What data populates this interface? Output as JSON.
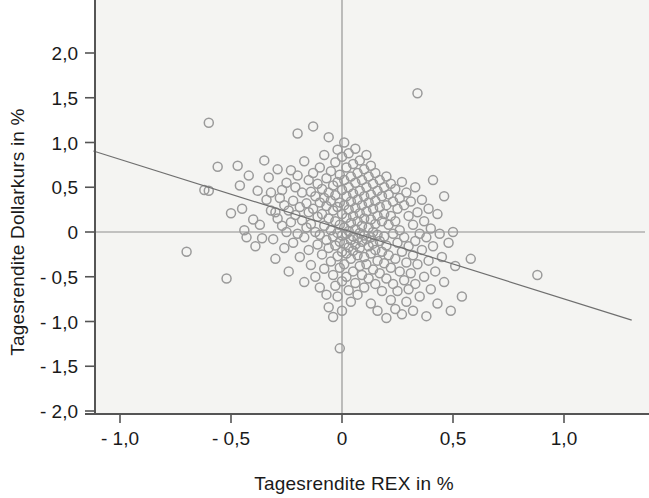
{
  "chart_data": {
    "type": "scatter",
    "title": "",
    "xlabel": "Tagesrendite REX in %",
    "ylabel": "Tagesrendite Dollarkurs in %",
    "xlim": [
      -1.12,
      1.38
    ],
    "ylim": [
      -2.08,
      2.28
    ],
    "xticks": [
      -1.0,
      -0.5,
      0,
      0.5,
      1.0
    ],
    "xticklabels": [
      "- 1,0",
      "- 0,5",
      "0",
      "0,5",
      "1,0"
    ],
    "yticks": [
      2.0,
      1.5,
      1.0,
      0.5,
      0,
      -0.5,
      -1.0,
      -1.5,
      -2.0
    ],
    "yticklabels": [
      "2,0",
      "1,5",
      "1,0",
      "0,5",
      "0",
      "- 0,5",
      "- 1,0",
      "- 1,5",
      "- 2,0"
    ],
    "grid": false,
    "legend": null,
    "marker": "open-circle",
    "marker_color": "#9a9a9a",
    "marker_size": 9,
    "plot_bg": "#f4f4f2",
    "axis_color": "#555555",
    "reference_lines": [
      {
        "name": "zero-horizontal",
        "orientation": "horizontal",
        "value": 0
      },
      {
        "name": "zero-vertical",
        "orientation": "vertical",
        "value": 0
      }
    ],
    "trendline": {
      "name": "regression-line",
      "x_start": -1.12,
      "y_start": 0.905,
      "x_end": 1.305,
      "y_end": -0.985,
      "slope": -0.781,
      "intercept": 0.03
    },
    "points": [
      [
        -0.7,
        -0.22
      ],
      [
        -0.62,
        0.47
      ],
      [
        -0.6,
        1.22
      ],
      [
        -0.6,
        0.46
      ],
      [
        -0.56,
        0.73
      ],
      [
        -0.52,
        -0.52
      ],
      [
        -0.5,
        0.21
      ],
      [
        -0.47,
        0.74
      ],
      [
        -0.46,
        0.52
      ],
      [
        -0.45,
        0.26
      ],
      [
        -0.44,
        0.02
      ],
      [
        -0.43,
        -0.06
      ],
      [
        -0.42,
        0.63
      ],
      [
        -0.4,
        0.14
      ],
      [
        -0.39,
        -0.16
      ],
      [
        -0.38,
        0.46
      ],
      [
        -0.37,
        0.08
      ],
      [
        -0.36,
        -0.07
      ],
      [
        -0.35,
        0.8
      ],
      [
        -0.34,
        0.36
      ],
      [
        -0.33,
        0.61
      ],
      [
        -0.32,
        0.24
      ],
      [
        -0.32,
        0.44
      ],
      [
        -0.31,
        -0.08
      ],
      [
        -0.3,
        0.22
      ],
      [
        -0.3,
        -0.3
      ],
      [
        -0.29,
        0.15
      ],
      [
        -0.29,
        0.7
      ],
      [
        -0.28,
        0.38
      ],
      [
        -0.27,
        0.07
      ],
      [
        -0.27,
        0.47
      ],
      [
        -0.26,
        -0.18
      ],
      [
        -0.26,
        0.3
      ],
      [
        -0.25,
        0.55
      ],
      [
        -0.25,
        0.0
      ],
      [
        -0.24,
        0.24
      ],
      [
        -0.24,
        -0.44
      ],
      [
        -0.23,
        0.69
      ],
      [
        -0.23,
        0.11
      ],
      [
        -0.22,
        0.35
      ],
      [
        -0.22,
        -0.12
      ],
      [
        -0.21,
        0.5
      ],
      [
        -0.21,
        0.19
      ],
      [
        -0.2,
        1.1
      ],
      [
        -0.2,
        0.63
      ],
      [
        -0.2,
        -0.02
      ],
      [
        -0.19,
        0.28
      ],
      [
        -0.19,
        -0.28
      ],
      [
        -0.18,
        0.44
      ],
      [
        -0.18,
        0.13
      ],
      [
        -0.17,
        0.79
      ],
      [
        -0.17,
        -0.06
      ],
      [
        -0.17,
        -0.56
      ],
      [
        -0.16,
        0.32
      ],
      [
        -0.16,
        0.05
      ],
      [
        -0.15,
        0.58
      ],
      [
        -0.15,
        0.22
      ],
      [
        -0.15,
        -0.2
      ],
      [
        -0.14,
        0.45
      ],
      [
        -0.14,
        0.09
      ],
      [
        -0.14,
        -0.37
      ],
      [
        -0.13,
        1.18
      ],
      [
        -0.13,
        0.66
      ],
      [
        -0.13,
        0.26
      ],
      [
        -0.12,
        0.4
      ],
      [
        -0.12,
        0.0
      ],
      [
        -0.12,
        -0.5
      ],
      [
        -0.11,
        0.54
      ],
      [
        -0.11,
        0.17
      ],
      [
        -0.11,
        -0.14
      ],
      [
        -0.1,
        0.72
      ],
      [
        -0.1,
        0.33
      ],
      [
        -0.1,
        -0.03
      ],
      [
        -0.1,
        -0.62
      ],
      [
        -0.09,
        0.48
      ],
      [
        -0.09,
        0.2
      ],
      [
        -0.09,
        -0.25
      ],
      [
        -0.08,
        0.86
      ],
      [
        -0.08,
        0.38
      ],
      [
        -0.08,
        0.07
      ],
      [
        -0.08,
        -0.41
      ],
      [
        -0.07,
        0.6
      ],
      [
        -0.07,
        0.29
      ],
      [
        -0.07,
        -0.09
      ],
      [
        -0.07,
        -0.7
      ],
      [
        -0.06,
        1.06
      ],
      [
        -0.06,
        0.44
      ],
      [
        -0.06,
        0.15
      ],
      [
        -0.06,
        -0.18
      ],
      [
        -0.06,
        -0.84
      ],
      [
        -0.05,
        0.68
      ],
      [
        -0.05,
        0.35
      ],
      [
        -0.05,
        0.02
      ],
      [
        -0.05,
        -0.33
      ],
      [
        -0.04,
        0.52
      ],
      [
        -0.04,
        0.24
      ],
      [
        -0.04,
        -0.05
      ],
      [
        -0.04,
        -0.48
      ],
      [
        -0.04,
        -0.95
      ],
      [
        -0.03,
        0.78
      ],
      [
        -0.03,
        0.41
      ],
      [
        -0.03,
        0.12
      ],
      [
        -0.03,
        -0.15
      ],
      [
        -0.03,
        -0.6
      ],
      [
        -0.02,
        0.92
      ],
      [
        -0.02,
        0.56
      ],
      [
        -0.02,
        0.28
      ],
      [
        -0.02,
        -0.01
      ],
      [
        -0.02,
        -0.27
      ],
      [
        -0.02,
        -0.72
      ],
      [
        -0.01,
        0.64
      ],
      [
        -0.01,
        0.33
      ],
      [
        -0.01,
        0.08
      ],
      [
        -0.01,
        -0.11
      ],
      [
        -0.01,
        -0.4
      ],
      [
        -0.01,
        -1.3
      ],
      [
        0.0,
        0.84
      ],
      [
        0.0,
        0.47
      ],
      [
        0.0,
        0.2
      ],
      [
        0.0,
        -0.04
      ],
      [
        0.0,
        -0.22
      ],
      [
        0.0,
        -0.55
      ],
      [
        0.0,
        -0.88
      ],
      [
        0.01,
        1.0
      ],
      [
        0.01,
        0.58
      ],
      [
        0.01,
        0.3
      ],
      [
        0.01,
        0.05
      ],
      [
        0.01,
        -0.13
      ],
      [
        0.01,
        -0.36
      ],
      [
        0.02,
        0.72
      ],
      [
        0.02,
        0.4
      ],
      [
        0.02,
        0.16
      ],
      [
        0.02,
        -0.02
      ],
      [
        0.02,
        -0.24
      ],
      [
        0.02,
        -0.5
      ],
      [
        0.03,
        0.88
      ],
      [
        0.03,
        0.5
      ],
      [
        0.03,
        0.25
      ],
      [
        0.03,
        0.01
      ],
      [
        0.03,
        -0.17
      ],
      [
        0.03,
        -0.65
      ],
      [
        0.04,
        0.62
      ],
      [
        0.04,
        0.34
      ],
      [
        0.04,
        0.1
      ],
      [
        0.04,
        -0.09
      ],
      [
        0.04,
        -0.3
      ],
      [
        0.04,
        -0.78
      ],
      [
        0.05,
        0.76
      ],
      [
        0.05,
        0.43
      ],
      [
        0.05,
        0.18
      ],
      [
        0.05,
        -0.05
      ],
      [
        0.05,
        -0.21
      ],
      [
        0.05,
        -0.44
      ],
      [
        0.06,
        0.93
      ],
      [
        0.06,
        0.55
      ],
      [
        0.06,
        0.27
      ],
      [
        0.06,
        0.03
      ],
      [
        0.06,
        -0.14
      ],
      [
        0.06,
        -0.57
      ],
      [
        0.07,
        0.66
      ],
      [
        0.07,
        0.36
      ],
      [
        0.07,
        0.12
      ],
      [
        0.07,
        -0.07
      ],
      [
        0.07,
        -0.26
      ],
      [
        0.07,
        -0.7
      ],
      [
        0.08,
        0.8
      ],
      [
        0.08,
        0.46
      ],
      [
        0.08,
        0.21
      ],
      [
        0.08,
        -0.01
      ],
      [
        0.08,
        -0.18
      ],
      [
        0.08,
        -0.38
      ],
      [
        0.09,
        0.58
      ],
      [
        0.09,
        0.3
      ],
      [
        0.09,
        0.07
      ],
      [
        0.09,
        -0.11
      ],
      [
        0.09,
        -0.48
      ],
      [
        0.1,
        0.7
      ],
      [
        0.1,
        0.4
      ],
      [
        0.1,
        0.15
      ],
      [
        0.1,
        -0.04
      ],
      [
        0.1,
        -0.28
      ],
      [
        0.1,
        -0.62
      ],
      [
        0.11,
        0.86
      ],
      [
        0.11,
        0.5
      ],
      [
        0.11,
        0.23
      ],
      [
        0.11,
        -0.08
      ],
      [
        0.11,
        -0.36
      ],
      [
        0.12,
        0.62
      ],
      [
        0.12,
        0.33
      ],
      [
        0.12,
        0.05
      ],
      [
        0.12,
        -0.16
      ],
      [
        0.12,
        -0.52
      ],
      [
        0.13,
        0.74
      ],
      [
        0.13,
        0.42
      ],
      [
        0.13,
        0.14
      ],
      [
        0.13,
        -0.06
      ],
      [
        0.13,
        -0.24
      ],
      [
        0.13,
        -0.8
      ],
      [
        0.14,
        0.54
      ],
      [
        0.14,
        0.26
      ],
      [
        0.14,
        0.0
      ],
      [
        0.14,
        -0.13
      ],
      [
        0.14,
        -0.42
      ],
      [
        0.15,
        0.66
      ],
      [
        0.15,
        0.35
      ],
      [
        0.15,
        0.09
      ],
      [
        0.15,
        -0.2
      ],
      [
        0.15,
        -0.58
      ],
      [
        0.16,
        0.46
      ],
      [
        0.16,
        0.18
      ],
      [
        0.16,
        -0.03
      ],
      [
        0.16,
        -0.32
      ],
      [
        0.16,
        -0.88
      ],
      [
        0.17,
        0.58
      ],
      [
        0.17,
        0.28
      ],
      [
        0.17,
        -0.1
      ],
      [
        0.17,
        -0.46
      ],
      [
        0.18,
        0.4
      ],
      [
        0.18,
        0.12
      ],
      [
        0.18,
        -0.22
      ],
      [
        0.18,
        -0.66
      ],
      [
        0.19,
        0.5
      ],
      [
        0.19,
        0.2
      ],
      [
        0.19,
        -0.05
      ],
      [
        0.19,
        -0.35
      ],
      [
        0.2,
        0.62
      ],
      [
        0.2,
        0.3
      ],
      [
        0.2,
        -0.15
      ],
      [
        0.2,
        -0.52
      ],
      [
        0.2,
        -0.96
      ],
      [
        0.21,
        0.42
      ],
      [
        0.21,
        0.08
      ],
      [
        0.21,
        -0.26
      ],
      [
        0.22,
        0.54
      ],
      [
        0.22,
        0.18
      ],
      [
        0.22,
        -0.4
      ],
      [
        0.22,
        -0.76
      ],
      [
        0.23,
        0.34
      ],
      [
        0.23,
        -0.02
      ],
      [
        0.23,
        -0.58
      ],
      [
        0.24,
        0.48
      ],
      [
        0.24,
        0.12
      ],
      [
        0.24,
        -0.3
      ],
      [
        0.24,
        -0.86
      ],
      [
        0.25,
        0.26
      ],
      [
        0.25,
        -0.12
      ],
      [
        0.25,
        -0.66
      ],
      [
        0.26,
        0.38
      ],
      [
        0.26,
        0.02
      ],
      [
        0.26,
        -0.44
      ],
      [
        0.27,
        0.56
      ],
      [
        0.27,
        -0.22
      ],
      [
        0.27,
        -0.92
      ],
      [
        0.28,
        0.3
      ],
      [
        0.28,
        -0.06
      ],
      [
        0.28,
        -0.54
      ],
      [
        0.29,
        0.44
      ],
      [
        0.29,
        -0.34
      ],
      [
        0.29,
        -0.78
      ],
      [
        0.3,
        0.18
      ],
      [
        0.3,
        -0.16
      ],
      [
        0.3,
        -0.64
      ],
      [
        0.31,
        0.34
      ],
      [
        0.31,
        -0.46
      ],
      [
        0.32,
        0.08
      ],
      [
        0.32,
        -0.26
      ],
      [
        0.32,
        -0.88
      ],
      [
        0.33,
        0.5
      ],
      [
        0.33,
        -0.1
      ],
      [
        0.33,
        -0.58
      ],
      [
        0.34,
        1.55
      ],
      [
        0.34,
        0.22
      ],
      [
        0.34,
        -0.36
      ],
      [
        0.35,
        -0.02
      ],
      [
        0.35,
        -0.72
      ],
      [
        0.36,
        0.36
      ],
      [
        0.36,
        -0.2
      ],
      [
        0.37,
        0.12
      ],
      [
        0.37,
        -0.5
      ],
      [
        0.38,
        -0.06
      ],
      [
        0.38,
        -0.94
      ],
      [
        0.39,
        0.26
      ],
      [
        0.39,
        -0.32
      ],
      [
        0.4,
        0.04
      ],
      [
        0.4,
        -0.64
      ],
      [
        0.41,
        0.58
      ],
      [
        0.41,
        -0.16
      ],
      [
        0.42,
        -0.44
      ],
      [
        0.43,
        0.2
      ],
      [
        0.43,
        -0.8
      ],
      [
        0.44,
        -0.02
      ],
      [
        0.45,
        -0.28
      ],
      [
        0.46,
        0.4
      ],
      [
        0.46,
        -0.56
      ],
      [
        0.48,
        -0.12
      ],
      [
        0.49,
        -0.88
      ],
      [
        0.5,
        0.0
      ],
      [
        0.51,
        -0.38
      ],
      [
        0.54,
        -0.72
      ],
      [
        0.58,
        -0.3
      ],
      [
        0.88,
        -0.48
      ]
    ]
  }
}
